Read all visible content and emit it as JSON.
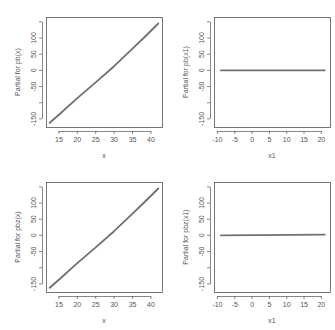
{
  "chart_data": [
    {
      "type": "line",
      "panel": "top-left",
      "title": "",
      "xlabel": "x",
      "ylabel": "Partial for pb(x)",
      "xlim": [
        11.5,
        43
      ],
      "ylim": [
        -175,
        165
      ],
      "xticks": [
        15,
        20,
        25,
        30,
        35,
        40
      ],
      "yticks": [
        -150,
        -100,
        -50,
        0,
        50,
        100,
        150
      ],
      "ytick_labels": [
        "-150",
        "",
        "-50",
        "0",
        "50",
        "100",
        ""
      ],
      "grid": false,
      "x": [
        12.5,
        15,
        20,
        25,
        30,
        35,
        38,
        42
      ],
      "y": [
        -162,
        -137,
        -86,
        -37,
        13,
        67,
        100,
        145
      ]
    },
    {
      "type": "line",
      "panel": "top-right",
      "title": "",
      "xlabel": "x1",
      "ylabel": "Partial for pb(x1)",
      "xlim": [
        -11,
        22.5
      ],
      "ylim": [
        -175,
        165
      ],
      "xticks": [
        -10,
        -5,
        0,
        5,
        10,
        15,
        20
      ],
      "yticks": [
        -150,
        -100,
        -50,
        0,
        50,
        100,
        150
      ],
      "ytick_labels": [
        "-150",
        "",
        "-50",
        "0",
        "50",
        "100",
        ""
      ],
      "grid": false,
      "x": [
        -9,
        21
      ],
      "y": [
        0,
        0
      ]
    },
    {
      "type": "line",
      "panel": "bottom-left",
      "title": "",
      "xlabel": "x",
      "ylabel": "Partial for pbz(x)",
      "xlim": [
        11.5,
        43
      ],
      "ylim": [
        -175,
        165
      ],
      "xticks": [
        15,
        20,
        25,
        30,
        35,
        40
      ],
      "yticks": [
        -150,
        -100,
        -50,
        0,
        50,
        100,
        150
      ],
      "ytick_labels": [
        "-150",
        "",
        "-50",
        "0",
        "50",
        "100",
        ""
      ],
      "grid": false,
      "x": [
        12.5,
        15,
        20,
        25,
        30,
        35,
        38,
        42
      ],
      "y": [
        -162,
        -137,
        -86,
        -37,
        13,
        67,
        100,
        145
      ]
    },
    {
      "type": "line",
      "panel": "bottom-right",
      "title": "",
      "xlabel": "x1",
      "ylabel": "Partial for pbz(x1)",
      "xlim": [
        -11,
        22.5
      ],
      "ylim": [
        -175,
        165
      ],
      "xticks": [
        -10,
        -5,
        0,
        5,
        10,
        15,
        20
      ],
      "yticks": [
        -150,
        -100,
        -50,
        0,
        50,
        100,
        150
      ],
      "ytick_labels": [
        "-150",
        "",
        "-50",
        "0",
        "50",
        "100",
        ""
      ],
      "grid": false,
      "x": [
        -9,
        21
      ],
      "y": [
        0,
        2
      ]
    }
  ],
  "colors": {
    "line": "#707070",
    "axis": "#555555",
    "text": "#555555"
  }
}
